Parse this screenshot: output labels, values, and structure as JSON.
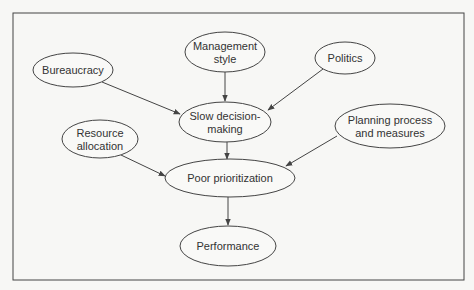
{
  "diagram": {
    "type": "causal-flow",
    "nodes": [
      {
        "id": "bureaucracy",
        "lines": [
          "Bureaucracy"
        ],
        "cx": 73,
        "cy": 70,
        "rx": 40,
        "ry": 17
      },
      {
        "id": "management",
        "lines": [
          "Management",
          "style"
        ],
        "cx": 225,
        "cy": 52,
        "rx": 40,
        "ry": 20
      },
      {
        "id": "politics",
        "lines": [
          "Politics"
        ],
        "cx": 345,
        "cy": 58,
        "rx": 30,
        "ry": 16
      },
      {
        "id": "slow",
        "lines": [
          "Slow decision-",
          "making"
        ],
        "cx": 225,
        "cy": 122,
        "rx": 46,
        "ry": 20
      },
      {
        "id": "resource",
        "lines": [
          "Resource",
          "allocation"
        ],
        "cx": 100,
        "cy": 139,
        "rx": 38,
        "ry": 19
      },
      {
        "id": "planning",
        "lines": [
          "Planning process",
          "and measures"
        ],
        "cx": 390,
        "cy": 126,
        "rx": 55,
        "ry": 22
      },
      {
        "id": "poor",
        "lines": [
          "Poor prioritization"
        ],
        "cx": 230,
        "cy": 178,
        "rx": 65,
        "ry": 19
      },
      {
        "id": "performance",
        "lines": [
          "Performance"
        ],
        "cx": 228,
        "cy": 246,
        "rx": 48,
        "ry": 20
      }
    ],
    "edges": [
      {
        "from": "bureaucracy",
        "to": "slow",
        "x1": 102,
        "y1": 82,
        "x2": 180,
        "y2": 114
      },
      {
        "from": "management",
        "to": "slow",
        "x1": 225,
        "y1": 72,
        "x2": 225,
        "y2": 101
      },
      {
        "from": "politics",
        "to": "slow",
        "x1": 323,
        "y1": 69,
        "x2": 268,
        "y2": 110
      },
      {
        "from": "resource",
        "to": "poor",
        "x1": 121,
        "y1": 155,
        "x2": 165,
        "y2": 176
      },
      {
        "from": "slow",
        "to": "poor",
        "x1": 227,
        "y1": 142,
        "x2": 227,
        "y2": 159
      },
      {
        "from": "planning",
        "to": "poor",
        "x1": 337,
        "y1": 136,
        "x2": 286,
        "y2": 166
      },
      {
        "from": "poor",
        "to": "performance",
        "x1": 228,
        "y1": 197,
        "x2": 228,
        "y2": 225
      }
    ],
    "frame": {
      "x": 13,
      "y": 13,
      "w": 451,
      "h": 267
    }
  }
}
